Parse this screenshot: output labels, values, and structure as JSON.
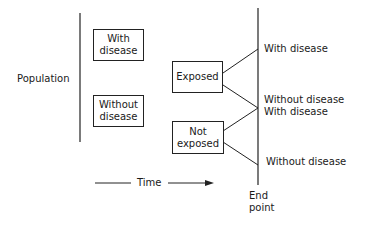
{
  "population": {
    "label": "Population",
    "boxes": [
      {
        "line1": "With",
        "line2": "disease"
      },
      {
        "line1": "Without",
        "line2": "disease"
      }
    ]
  },
  "exposure": {
    "exposed": {
      "label": "Exposed"
    },
    "not_exposed": {
      "line1": "Not",
      "line2": "exposed"
    }
  },
  "outcomes": [
    {
      "label": "With disease"
    },
    {
      "label": "Without disease"
    },
    {
      "label": "With disease"
    },
    {
      "label": "Without disease"
    }
  ],
  "time_axis": {
    "label": "Time"
  },
  "end_point": {
    "line1": "End",
    "line2": "point"
  }
}
